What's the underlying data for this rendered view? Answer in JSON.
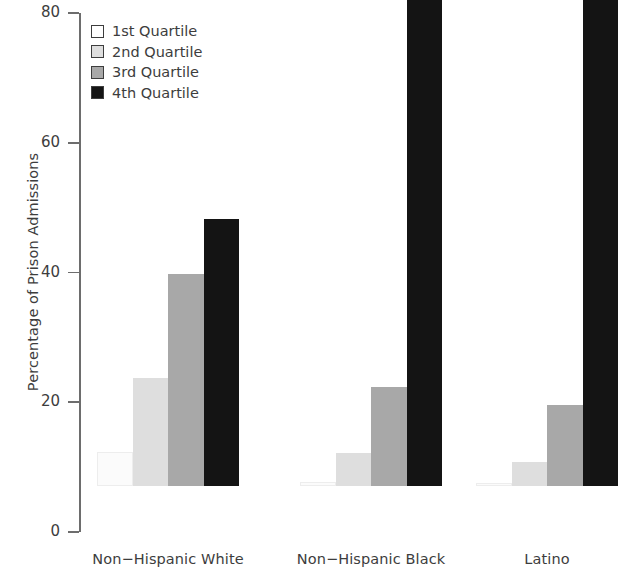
{
  "chart": {
    "ylabel": "Percentage of Prison Admissions",
    "ytick_labels": [
      "0",
      "20",
      "40",
      "60",
      "80"
    ],
    "group_labels": [
      "Non−Hispanic White",
      "Non−Hispanic Black",
      "Latino"
    ],
    "legend": [
      {
        "label": "1st Quartile",
        "color": "#ffffff"
      },
      {
        "label": "2nd Quartile",
        "color": "#dedede"
      },
      {
        "label": "3rd Quartile",
        "color": "#a8a8a8"
      },
      {
        "label": "4th Quartile",
        "color": "#141414"
      }
    ]
  },
  "chart_data": {
    "type": "bar",
    "title": "",
    "xlabel": "",
    "ylabel": "Percentage of Prison Admissions",
    "categories": [
      "Non−Hispanic White",
      "Non−Hispanic Black",
      "Latino"
    ],
    "series": [
      {
        "name": "1st Quartile",
        "color": "#ffffff",
        "values": [
          5.2,
          0.6,
          0.4
        ]
      },
      {
        "name": "2nd Quartile",
        "color": "#dedede",
        "values": [
          16.6,
          5.1,
          3.7
        ]
      },
      {
        "name": "3rd Quartile",
        "color": "#a8a8a8",
        "values": [
          32.7,
          15.2,
          12.5
        ]
      },
      {
        "name": "4th Quartile",
        "color": "#141414",
        "values": [
          41.2,
          76.2,
          80.3
        ]
      }
    ],
    "ylim": [
      0,
      80
    ],
    "yticks": [
      0,
      20,
      40,
      60,
      80
    ],
    "grid": false,
    "legend_position": "top-left"
  }
}
